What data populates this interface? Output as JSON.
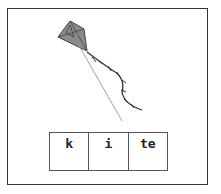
{
  "picture": {
    "subject": "kite",
    "kite_color": "#8a8a8a"
  },
  "word_boxes": [
    {
      "text": "k"
    },
    {
      "text": "i"
    },
    {
      "text": "te"
    }
  ]
}
